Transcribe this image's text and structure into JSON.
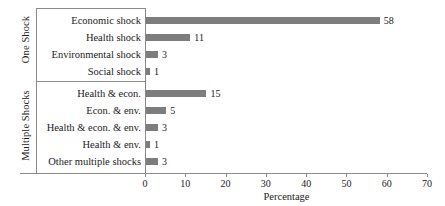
{
  "chart_data": {
    "type": "bar",
    "orientation": "horizontal",
    "title": "",
    "xlabel": "Percentage",
    "ylabel": "",
    "xlim": [
      0,
      70
    ],
    "xticks": [
      0,
      10,
      20,
      30,
      40,
      50,
      60,
      70
    ],
    "grid": false,
    "legend": null,
    "bar_color": "#7d7d7d",
    "axis_color": "#8a8a8a",
    "groups": [
      {
        "name": "One Shock",
        "categories": [
          "Economic shock",
          "Health shock",
          "Environmental shock",
          "Social shock"
        ],
        "values": [
          58,
          11,
          3,
          1
        ]
      },
      {
        "name": "Multiple Shocks",
        "categories": [
          "Health & econ.",
          "Econ. & env.",
          "Health & econ. & env.",
          "Health & env.",
          "Other multiple shocks"
        ],
        "values": [
          15,
          5,
          3,
          1,
          3
        ]
      }
    ],
    "categories": [
      "Economic shock",
      "Health shock",
      "Environmental shock",
      "Social shock",
      "Health & econ.",
      "Econ. & env.",
      "Health & econ. & env.",
      "Health & env.",
      "Other multiple shocks"
    ],
    "values": [
      58,
      11,
      3,
      1,
      15,
      5,
      3,
      1,
      3
    ]
  }
}
